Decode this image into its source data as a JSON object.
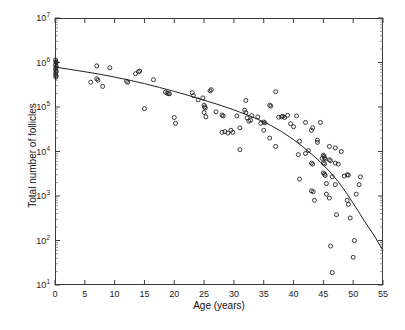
{
  "chart_data": {
    "type": "scatter",
    "title": "",
    "xlabel": "Age (years)",
    "ylabel": "Total number of follicles",
    "xlim": [
      0,
      55
    ],
    "ylim": [
      10,
      10000000
    ],
    "yscale": "log",
    "xscale": "linear",
    "grid": false,
    "legend": null,
    "xticks": [
      0,
      5,
      10,
      15,
      20,
      25,
      30,
      35,
      40,
      45,
      50,
      55
    ],
    "xtick_labels": [
      "0",
      "5",
      "10",
      "15",
      "20",
      "25",
      "30",
      "35",
      "40",
      "45",
      "50",
      "55"
    ],
    "yticks": [
      10,
      100,
      1000,
      10000,
      100000,
      1000000,
      10000000
    ],
    "ytick_labels": [
      "10¹",
      "10²",
      "10³",
      "10⁴",
      "10⁵",
      "10⁶",
      "10⁷"
    ],
    "ytick_mantissa": [
      "10",
      "10",
      "10",
      "10",
      "10",
      "10",
      "10"
    ],
    "ytick_exponent": [
      "1",
      "2",
      "3",
      "4",
      "5",
      "6",
      "7"
    ],
    "marker": "open-circle",
    "marker_color": "#222222",
    "marker_size": 4,
    "line_color": "#222222",
    "line_width": 1,
    "series": [
      {
        "name": "Observed follicle counts",
        "type": "scatter",
        "points": [
          [
            0.1,
            1150000
          ],
          [
            0.15,
            1050000
          ],
          [
            0.2,
            1000000
          ],
          [
            0.1,
            900000
          ],
          [
            0.2,
            820000
          ],
          [
            0.15,
            760000
          ],
          [
            0.1,
            700000
          ],
          [
            0.2,
            640000
          ],
          [
            0.15,
            600000
          ],
          [
            0.1,
            540000
          ],
          [
            0.2,
            500000
          ],
          [
            0.15,
            470000
          ],
          [
            6.0,
            360000
          ],
          [
            7.0,
            840000
          ],
          [
            7.0,
            430000
          ],
          [
            7.2,
            400000
          ],
          [
            8.0,
            290000
          ],
          [
            9.2,
            760000
          ],
          [
            12.0,
            380000
          ],
          [
            12.2,
            360000
          ],
          [
            13.5,
            560000
          ],
          [
            14.0,
            620000
          ],
          [
            14.2,
            640000
          ],
          [
            15.0,
            92000
          ],
          [
            16.5,
            410000
          ],
          [
            18.5,
            215000
          ],
          [
            18.8,
            205000
          ],
          [
            19.0,
            200000
          ],
          [
            19.2,
            198000
          ],
          [
            20.0,
            58000
          ],
          [
            20.2,
            43000
          ],
          [
            23.0,
            210000
          ],
          [
            23.2,
            180000
          ],
          [
            24.0,
            145000
          ],
          [
            24.8,
            160000
          ],
          [
            25.0,
            110000
          ],
          [
            25.1,
            100000
          ],
          [
            25.2,
            95000
          ],
          [
            25.0,
            75000
          ],
          [
            25.3,
            60000
          ],
          [
            26.0,
            230000
          ],
          [
            26.2,
            245000
          ],
          [
            27.0,
            78000
          ],
          [
            28.0,
            66000
          ],
          [
            28.2,
            63000
          ],
          [
            28.0,
            27000
          ],
          [
            28.5,
            28000
          ],
          [
            29.0,
            26000
          ],
          [
            29.5,
            30000
          ],
          [
            29.8,
            27000
          ],
          [
            30.5,
            63000
          ],
          [
            31.0,
            11000
          ],
          [
            31.0,
            34000
          ],
          [
            31.8,
            85000
          ],
          [
            32.0,
            140000
          ],
          [
            32.0,
            75000
          ],
          [
            32.2,
            57000
          ],
          [
            32.5,
            48000
          ],
          [
            32.8,
            50000
          ],
          [
            33.0,
            64000
          ],
          [
            34.0,
            60000
          ],
          [
            34.5,
            43000
          ],
          [
            35.0,
            46000
          ],
          [
            35.2,
            44000
          ],
          [
            35.0,
            30000
          ],
          [
            36.0,
            110000
          ],
          [
            36.2,
            105000
          ],
          [
            36.0,
            20000
          ],
          [
            37.0,
            220000
          ],
          [
            37.0,
            13000
          ],
          [
            37.5,
            59000
          ],
          [
            38.0,
            60000
          ],
          [
            38.2,
            62000
          ],
          [
            38.5,
            58000
          ],
          [
            39.0,
            65000
          ],
          [
            39.5,
            42000
          ],
          [
            40.0,
            36000
          ],
          [
            40.5,
            63000
          ],
          [
            40.8,
            8500
          ],
          [
            41.0,
            17000
          ],
          [
            41.0,
            2400
          ],
          [
            42.0,
            45000
          ],
          [
            42.0,
            9000
          ],
          [
            42.5,
            10500
          ],
          [
            43.0,
            30000
          ],
          [
            43.2,
            34000
          ],
          [
            43.0,
            5500
          ],
          [
            43.2,
            5200
          ],
          [
            43.0,
            1300
          ],
          [
            43.3,
            1250
          ],
          [
            43.5,
            800
          ],
          [
            44.0,
            18000
          ],
          [
            44.0,
            16000
          ],
          [
            44.5,
            45000
          ],
          [
            44.8,
            7000
          ],
          [
            45.0,
            8300
          ],
          [
            45.1,
            7800
          ],
          [
            45.2,
            7200
          ],
          [
            45.3,
            6800
          ],
          [
            45.0,
            5500
          ],
          [
            45.2,
            5300
          ],
          [
            45.0,
            3300
          ],
          [
            45.2,
            3100
          ],
          [
            45.3,
            2900
          ],
          [
            45.5,
            1900
          ],
          [
            45.5,
            1100
          ],
          [
            46.0,
            13000
          ],
          [
            46.0,
            6500
          ],
          [
            46.2,
            6200
          ],
          [
            46.5,
            2700
          ],
          [
            46.0,
            900
          ],
          [
            46.2,
            75
          ],
          [
            46.5,
            19
          ],
          [
            47.0,
            12000
          ],
          [
            47.0,
            5500
          ],
          [
            47.5,
            5200
          ],
          [
            47.0,
            1800
          ],
          [
            47.2,
            380
          ],
          [
            48.0,
            10000
          ],
          [
            48.5,
            2800
          ],
          [
            49.0,
            3000
          ],
          [
            49.2,
            2950
          ],
          [
            49.0,
            800
          ],
          [
            49.2,
            650
          ],
          [
            49.5,
            320
          ],
          [
            50.0,
            42
          ],
          [
            50.2,
            100
          ],
          [
            50.5,
            1100
          ],
          [
            51.0,
            1800
          ],
          [
            51.2,
            2700
          ]
        ]
      },
      {
        "name": "Fitted decline model",
        "type": "line",
        "points": [
          [
            0.0,
            790000
          ],
          [
            2.5,
            700000
          ],
          [
            5.0,
            620000
          ],
          [
            7.5,
            545000
          ],
          [
            10.0,
            470000
          ],
          [
            12.5,
            400000
          ],
          [
            15.0,
            335000
          ],
          [
            17.5,
            275000
          ],
          [
            20.0,
            225000
          ],
          [
            22.5,
            180000
          ],
          [
            25.0,
            142000
          ],
          [
            27.5,
            112000
          ],
          [
            30.0,
            86000
          ],
          [
            32.0,
            68000
          ],
          [
            34.0,
            53000
          ],
          [
            36.0,
            40000
          ],
          [
            38.0,
            28000
          ],
          [
            40.0,
            18500
          ],
          [
            41.5,
            13000
          ],
          [
            43.0,
            8800
          ],
          [
            44.5,
            5800
          ],
          [
            46.0,
            3600
          ],
          [
            47.5,
            2100
          ],
          [
            49.0,
            1100
          ],
          [
            50.5,
            540
          ],
          [
            52.0,
            260
          ],
          [
            53.5,
            130
          ],
          [
            55.0,
            60
          ]
        ]
      }
    ]
  }
}
